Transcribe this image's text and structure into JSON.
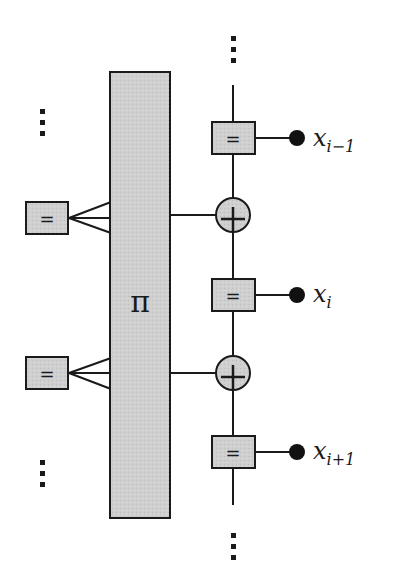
{
  "diagram": {
    "type": "factor-graph",
    "colors": {
      "fill": "#cfcfcf",
      "stroke": "#1a1a1a",
      "background": "#ffffff"
    },
    "interleaver": {
      "label": "π"
    },
    "left_nodes": [
      {
        "id": "eq-left-1",
        "label": "="
      },
      {
        "id": "eq-left-2",
        "label": "="
      }
    ],
    "right_chain": [
      {
        "id": "eq-right-1",
        "label": "=",
        "variable": {
          "base": "x",
          "sub": "i−1"
        }
      },
      {
        "id": "plus-1",
        "label": "+"
      },
      {
        "id": "eq-right-2",
        "label": "=",
        "variable": {
          "base": "x",
          "sub": "i"
        }
      },
      {
        "id": "plus-2",
        "label": "+"
      },
      {
        "id": "eq-right-3",
        "label": "=",
        "variable": {
          "base": "x",
          "sub": "i+1"
        }
      }
    ],
    "ellipsis": "⋮"
  }
}
